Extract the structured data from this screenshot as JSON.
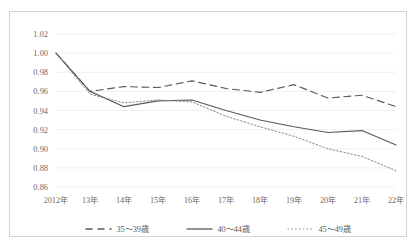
{
  "chart_data": {
    "type": "line",
    "title": "",
    "subtitle": "",
    "xlabel": "",
    "ylabel": "",
    "grid": true,
    "legend_position": "bottom",
    "ylim": [
      0.86,
      1.02
    ],
    "ytick_step": 0.02,
    "yticks": [
      "1.02",
      "1.00",
      "0.98",
      "0.96",
      "0.94",
      "0.92",
      "0.90",
      "0.88",
      "0.86"
    ],
    "ytick_values": [
      1.02,
      1.0,
      0.98,
      0.96,
      0.94,
      0.92,
      0.9,
      0.88,
      0.86
    ],
    "categories": [
      "2012年",
      "13年",
      "14年",
      "15年",
      "16年",
      "17年",
      "18年",
      "19年",
      "20年",
      "21年",
      "22年"
    ],
    "series": [
      {
        "name": "35～39歳",
        "style": "dashed",
        "color": "#595959",
        "values": [
          1.0,
          0.96,
          0.965,
          0.964,
          0.971,
          0.963,
          0.959,
          0.967,
          0.953,
          0.956,
          0.944
        ]
      },
      {
        "name": "40～44歳",
        "style": "solid",
        "color": "#595959",
        "values": [
          1.0,
          0.96,
          0.944,
          0.95,
          0.951,
          0.94,
          0.93,
          0.923,
          0.917,
          0.919,
          0.904
        ]
      },
      {
        "name": "45～49歳",
        "style": "dotted",
        "color": "#8c8c8c",
        "values": [
          1.0,
          0.957,
          0.948,
          0.951,
          0.949,
          0.934,
          0.923,
          0.913,
          0.9,
          0.892,
          0.877
        ]
      }
    ]
  },
  "figure": {
    "border_color": "#d4d4d4",
    "background": "#ffffff",
    "grid_color": "#e9e9e9",
    "text_color": "#6b6b6b"
  }
}
